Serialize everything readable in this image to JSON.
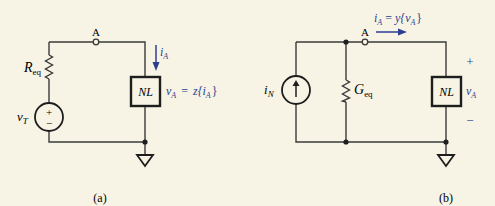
{
  "circuit_a": {
    "caption": "(a)",
    "node_label": "A",
    "resistor": {
      "symbol": "R",
      "subscript": "eq"
    },
    "voltage_source": {
      "symbol": "v",
      "subscript": "T",
      "plus": "+",
      "minus": "−"
    },
    "nonlinear_element": {
      "label": "NL"
    },
    "current_label": {
      "symbol": "i",
      "subscript": "A"
    },
    "relation": {
      "lhs": "v",
      "lhs_sub": "A",
      "eq": "=",
      "func": "z{i",
      "func_sub": "A",
      "close": "}"
    }
  },
  "circuit_b": {
    "caption": "(b)",
    "node_label": "A",
    "current_source": {
      "symbol": "i",
      "subscript": "N",
      "arrow": "↑"
    },
    "conductance": {
      "symbol": "G",
      "subscript": "eq"
    },
    "nonlinear_element": {
      "label": "NL"
    },
    "relation": {
      "lhs": "i",
      "lhs_sub": "A",
      "eq": "=",
      "func": "y{v",
      "func_sub": "A",
      "close": "}"
    },
    "voltage_label": {
      "symbol": "v",
      "subscript": "A",
      "plus": "+",
      "minus": "−"
    }
  },
  "colors": {
    "wire": "#3a3a3a",
    "annotation": "#2c3f8f",
    "background": "#f7f4e6"
  }
}
